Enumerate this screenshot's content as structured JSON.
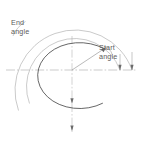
{
  "diagram": {
    "background_color": "#ffffff",
    "labels": {
      "end_angle": {
        "line1": "End",
        "line2": "angle",
        "full": "End angle"
      },
      "start_angle": {
        "line1": "Start",
        "line2": "angle",
        "full": "Start angle"
      }
    },
    "colors": {
      "ellipse_stroke": "#4a4a4a",
      "leader_stroke": "#9a9a9a",
      "centerline_stroke": "#b0b0b0",
      "radius_stroke": "#9a9a9a",
      "text": "#5b5b5b"
    },
    "geometry": {
      "center": {
        "x": 72,
        "y": 70
      },
      "ellipse": {
        "rx": 42,
        "ry": 33
      },
      "outer_circle": {
        "r": 60
      },
      "inner_leader_circle": {
        "r": 48
      },
      "start_angle_deg": 40,
      "end_angle_deg": 255
    }
  }
}
